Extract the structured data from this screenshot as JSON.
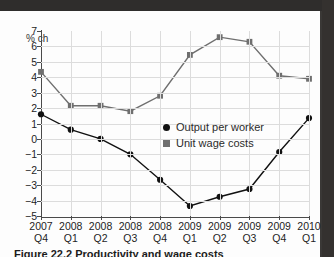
{
  "figure": {
    "caption": "Figure 22.2 Productivity and wage costs",
    "axis_title": "% ch"
  },
  "legend": {
    "position": "inside-center-right",
    "entries": [
      {
        "label": "Output per worker",
        "marker": "circle",
        "color": "#111111"
      },
      {
        "label": "Unit wage costs",
        "marker": "square",
        "color": "#6f6f6f"
      }
    ]
  },
  "chart_data": {
    "type": "line",
    "title": "",
    "subtitle": "",
    "xlabel": "",
    "ylabel": "% ch",
    "ylim": [
      -5,
      7
    ],
    "yticks": [
      7,
      6,
      5,
      4,
      3,
      2,
      1,
      0,
      -1,
      -2,
      -3,
      -4,
      -5
    ],
    "ytick_labels": [
      "7",
      "6",
      "5",
      "4",
      "3",
      "2",
      "1",
      "0",
      "−1",
      "−2",
      "−3",
      "−4",
      "−5"
    ],
    "grid": true,
    "legend_position": "inside",
    "categories": [
      "2007 Q4",
      "2008 Q1",
      "2008 Q2",
      "2008 Q3",
      "2008 Q4",
      "2009 Q1",
      "2009 Q2",
      "2009 Q3",
      "2009 Q4",
      "2010 Q1"
    ],
    "xtick_years": [
      "2007",
      "2008",
      "2008",
      "2008",
      "2008",
      "2009",
      "2009",
      "2009",
      "2009",
      "2010"
    ],
    "xtick_quarters": [
      "Q4",
      "Q1",
      "Q2",
      "Q3",
      "Q4",
      "Q1",
      "Q2",
      "Q3",
      "Q4",
      "Q1"
    ],
    "series": [
      {
        "name": "Output per worker",
        "marker": "circle",
        "color": "#111111",
        "values": [
          1.6,
          0.6,
          0.0,
          -1.0,
          -2.65,
          -4.35,
          -3.75,
          -3.25,
          -0.85,
          1.35
        ]
      },
      {
        "name": "Unit wage costs",
        "marker": "square",
        "color": "#6f6f6f",
        "values": [
          4.35,
          2.15,
          2.15,
          1.8,
          2.8,
          5.45,
          6.6,
          6.3,
          4.1,
          3.9
        ]
      }
    ]
  }
}
